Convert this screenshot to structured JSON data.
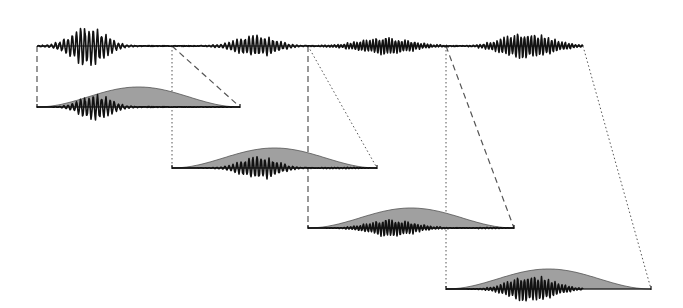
{
  "diagram": {
    "type": "signal-framing-windowing",
    "colors": {
      "background": "#ffffff",
      "signal": "#111111",
      "window_fill": "#a0a0a0",
      "window_stroke": "#555555",
      "guide_lines": "#555555"
    },
    "source_signal": {
      "baseline_y": 46,
      "x_start": 37,
      "x_end": 583,
      "bursts": [
        {
          "center": 88,
          "width": 70,
          "amp": 17,
          "period": 4.2
        },
        {
          "center": 256,
          "width": 80,
          "amp": 9,
          "period": 4.0
        },
        {
          "center": 385,
          "width": 110,
          "amp": 7,
          "period": 3.2
        },
        {
          "center": 527,
          "width": 100,
          "amp": 11,
          "period": 3.4
        }
      ]
    },
    "frames": [
      {
        "id": 1,
        "x_start": 37,
        "x_end": 240,
        "baseline_y": 107,
        "left_guide": "dashed",
        "right_guide": "dashed",
        "right_src_x": 172
      },
      {
        "id": 2,
        "x_start": 172,
        "x_end": 377,
        "baseline_y": 168,
        "left_guide": "dotted",
        "right_guide": "dotted",
        "right_src_x": 308
      },
      {
        "id": 3,
        "x_start": 308,
        "x_end": 514,
        "baseline_y": 228,
        "left_guide": "dashed",
        "right_guide": "dashed",
        "right_src_x": 446
      },
      {
        "id": 4,
        "x_start": 446,
        "x_end": 651,
        "baseline_y": 289,
        "left_guide": "dotted",
        "right_guide": "dotted",
        "right_src_x": 583
      }
    ],
    "window_height": 20
  }
}
